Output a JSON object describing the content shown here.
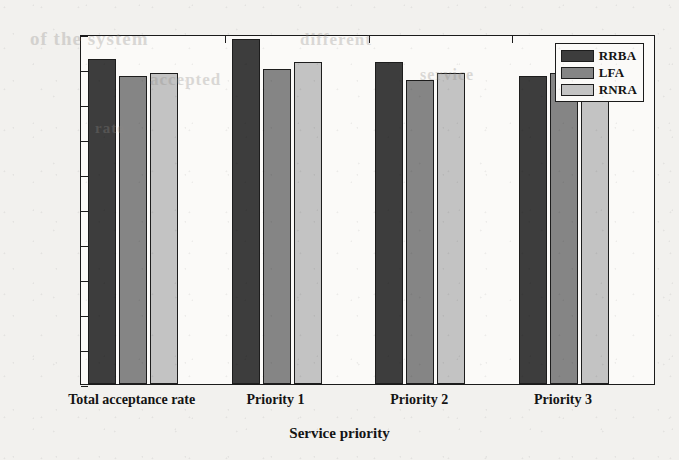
{
  "chart_data": {
    "type": "bar",
    "title": "",
    "subtitle": "",
    "xlabel": "Service priority",
    "ylabel": "Acceptance rate (%)",
    "categories": [
      "Total acceptance rate",
      "Priority 1",
      "Priority 2",
      "Priority 3"
    ],
    "series": [
      {
        "name": "RRBA",
        "color": "#3d3d3d",
        "values": [
          93,
          98.5,
          92,
          88
        ]
      },
      {
        "name": "LFA",
        "color": "#858585",
        "values": [
          88,
          90,
          87,
          89
        ]
      },
      {
        "name": "RNRA",
        "color": "#c3c3c3",
        "values": [
          89,
          92,
          89,
          88
        ]
      }
    ],
    "ylim": [
      0,
      100
    ],
    "yticks": [
      0,
      10,
      20,
      30,
      40,
      50,
      60,
      70,
      80,
      90,
      100
    ],
    "ytick_labels": [
      "0",
      "10",
      "20",
      "30",
      "40",
      "50",
      "60",
      "70",
      "80",
      "90",
      "100"
    ],
    "grid": false,
    "legend_position": "top-right",
    "legend_entries": [
      "RRBA",
      "LFA",
      "RNRA"
    ]
  },
  "scan_artifacts": {
    "ghost_lines": [
      {
        "text": "of the system",
        "x": 30,
        "y": 28,
        "size": 19
      },
      {
        "text": "different",
        "x": 300,
        "y": 30,
        "size": 17
      },
      {
        "text": "accepted",
        "x": 150,
        "y": 70,
        "size": 17
      },
      {
        "text": "service",
        "x": 420,
        "y": 66,
        "size": 16
      },
      {
        "text": "rate",
        "x": 95,
        "y": 120,
        "size": 15
      }
    ]
  }
}
